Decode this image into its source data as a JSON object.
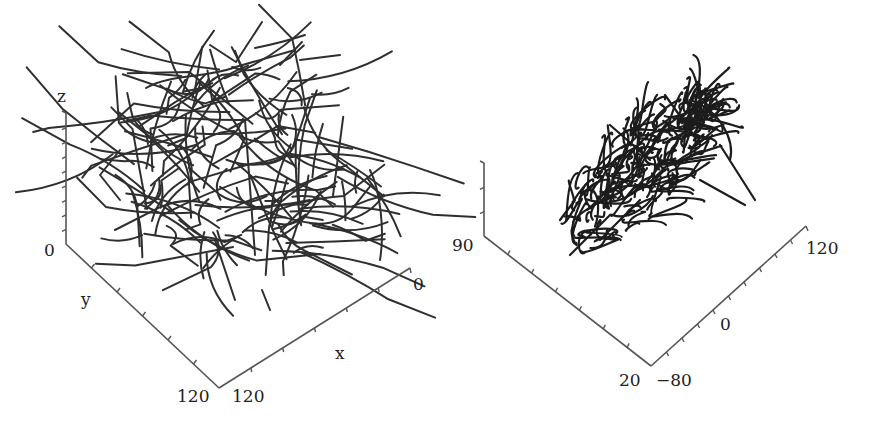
{
  "chart_data": [
    {
      "type": "line",
      "subtype": "3d-trajectory",
      "title": "",
      "axes": {
        "x": {
          "label": "x",
          "range": [
            0,
            120
          ],
          "tick_labels": [
            "0",
            "120"
          ],
          "minor_ticks": 6
        },
        "y": {
          "label": "y",
          "range": [
            0,
            120
          ],
          "tick_labels": [
            "0",
            "120"
          ],
          "minor_ticks": 6
        },
        "z": {
          "label": "z",
          "range": [
            0,
            null
          ],
          "tick_labels": [
            "0"
          ],
          "minor_ticks": 9
        }
      },
      "description": "Dense tangle of many random-walk trajectories spread across the full x-y domain",
      "series_count_estimate": 150,
      "seed": 7
    },
    {
      "type": "line",
      "subtype": "3d-trajectory",
      "title": "",
      "axes": {
        "x": {
          "label": "",
          "range": [
            -80,
            120
          ],
          "tick_labels": [
            "-80",
            "0",
            "120"
          ],
          "minor_ticks": 10
        },
        "y": {
          "label": "",
          "range": [
            20,
            90
          ],
          "tick_labels": [
            "90",
            "20"
          ],
          "minor_ticks": 7
        },
        "z": {
          "label": "",
          "range": [
            null,
            null
          ],
          "tick_labels": [],
          "minor_ticks": 3
        }
      },
      "description": "Compact, elongated dense cluster of looping trajectories oriented diagonally",
      "series_count_estimate": 220,
      "seed": 13
    }
  ]
}
